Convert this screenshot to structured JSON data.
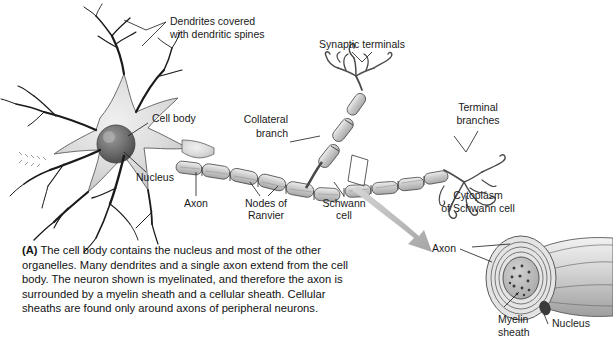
{
  "figure": {
    "background_color": "#ffffff",
    "ink_color": "#1a1a1a",
    "soma_fill": "#d8d8d8",
    "myelin_fill": "#c9c9c9",
    "arrow_color": "#b3b3b3"
  },
  "labels": {
    "dendrites_line1": "Dendrites covered",
    "dendrites_line2": "with dendritic spines",
    "synaptic_terminals": "Synaptic terminals",
    "cell_body": "Cell body",
    "nucleus": "Nucleus",
    "axon": "Axon",
    "nodes_line1": "Nodes of",
    "nodes_line2": "Ranvier",
    "collateral_line1": "Collateral",
    "collateral_line2": "branch",
    "schwann_line1": "Schwann",
    "schwann_line2": "cell",
    "terminal_line1": "Terminal",
    "terminal_line2": "branches"
  },
  "inset": {
    "cytoplasm_line1": "Cytoplasm",
    "cytoplasm_line2": "of Schwann cell",
    "axon": "Axon",
    "nucleus": "Nucleus",
    "myelin_line1": "Myelin",
    "myelin_line2": "sheath"
  },
  "caption": {
    "marker": "(A)",
    "text": " The cell body contains the nucleus and most of the other organelles. Many dendrites and a single axon extend from the cell body. The neuron shown is myelinated, and therefore the axon is surrounded by a myelin sheath and a cellular sheath. Cellular sheaths are found only around axons of peripheral neurons."
  }
}
